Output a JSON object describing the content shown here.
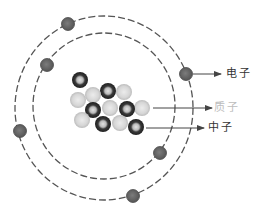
{
  "diagram": {
    "type": "atom-structure",
    "colors": {
      "background": "#ffffff",
      "orbit": "#555555",
      "electron": "#6a6a6a",
      "electron_stroke": "#4a4a4a",
      "neutron_outer": "#2e2e2e",
      "neutron_inner": "#c8c8c8",
      "proton_outer": "#c4c4c4",
      "proton_inner": "#e6e6e6",
      "arrow": "#444444",
      "label_dark": "#333333",
      "label_proton": "#bdbdbd"
    },
    "orbits": [
      {
        "name": "outer-orbit",
        "cx": 104,
        "cy": 108,
        "rx": 89,
        "ry": 92
      },
      {
        "name": "inner-orbit",
        "cx": 104,
        "cy": 106,
        "rx": 71,
        "ry": 73
      }
    ],
    "electrons": [
      {
        "x": 68,
        "y": 24
      },
      {
        "x": 47,
        "y": 65
      },
      {
        "x": 20,
        "y": 131
      },
      {
        "x": 186,
        "y": 74
      },
      {
        "x": 160,
        "y": 153
      },
      {
        "x": 133,
        "y": 196
      }
    ],
    "nucleus": {
      "neutrons": [
        {
          "x": 80,
          "y": 80
        },
        {
          "x": 108,
          "y": 91
        },
        {
          "x": 93,
          "y": 110
        },
        {
          "x": 127,
          "y": 109
        },
        {
          "x": 103,
          "y": 124
        },
        {
          "x": 136,
          "y": 127
        }
      ],
      "protons": [
        {
          "x": 78,
          "y": 100
        },
        {
          "x": 93,
          "y": 95
        },
        {
          "x": 124,
          "y": 92
        },
        {
          "x": 110,
          "y": 108
        },
        {
          "x": 142,
          "y": 108
        },
        {
          "x": 82,
          "y": 120
        },
        {
          "x": 120,
          "y": 123
        }
      ]
    },
    "callouts": [
      {
        "name": "electron",
        "text": "电子",
        "x1": 193,
        "y1": 74,
        "x2": 221,
        "label_x": 226,
        "label_y": 68
      },
      {
        "name": "proton",
        "text": "质子",
        "x1": 153,
        "y1": 108,
        "x2": 212,
        "label_x": 214,
        "label_y": 102
      },
      {
        "name": "neutron",
        "text": "中子",
        "x1": 146,
        "y1": 128,
        "x2": 204,
        "label_x": 208,
        "label_y": 122
      }
    ]
  }
}
